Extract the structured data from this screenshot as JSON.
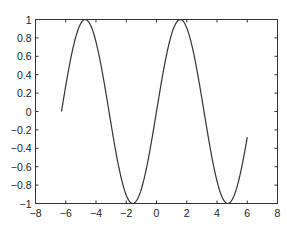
{
  "chart_data": {
    "type": "line",
    "title": "",
    "xlabel": "",
    "ylabel": "",
    "function": "y = sin(x)",
    "x_range_data": [
      -6.283,
      6.0
    ],
    "xlim": [
      -8,
      8
    ],
    "ylim": [
      -1,
      1
    ],
    "grid": false,
    "legend": null,
    "x_ticks": [
      -8,
      -6,
      -4,
      -2,
      0,
      2,
      4,
      6,
      8
    ],
    "x_tick_labels": [
      "−8",
      "−6",
      "−4",
      "−2",
      "0",
      "2",
      "4",
      "6",
      "8"
    ],
    "y_ticks": [
      1,
      0.8,
      0.6,
      0.4,
      0.2,
      0,
      -0.2,
      -0.4,
      -0.6,
      -0.8,
      -1
    ],
    "y_tick_labels": [
      "1",
      "0.8",
      "0.6",
      "0.4",
      "0.2",
      "0",
      "−0.2",
      "−0.4",
      "−0.6",
      "−0.8",
      "−1"
    ],
    "series": [
      {
        "name": "sin(x)",
        "color": "#333333",
        "x": [
          -6.283,
          -5.5,
          -4.712,
          -4.0,
          -3.142,
          -2.5,
          -1.571,
          -0.75,
          0,
          0.75,
          1.571,
          2.5,
          3.142,
          4.0,
          4.712,
          5.5,
          6.0
        ],
        "y": [
          0,
          0.706,
          1,
          0.757,
          0,
          -0.598,
          -1,
          -0.682,
          0,
          0.682,
          1,
          0.598,
          0,
          -0.757,
          -1,
          -0.706,
          -0.279
        ]
      }
    ]
  },
  "caption": ""
}
